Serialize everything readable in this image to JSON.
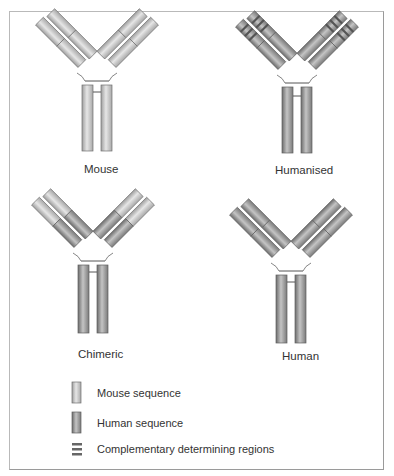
{
  "figure": {
    "antibodies": [
      {
        "id": "mouse",
        "label": "Mouse",
        "variable": "mouse",
        "constant": "mouse",
        "cdr": false
      },
      {
        "id": "humanised",
        "label": "Humanised",
        "variable": "human",
        "constant": "human",
        "cdr": true
      },
      {
        "id": "chimeric",
        "label": "Chimeric",
        "variable": "mouse",
        "constant": "human",
        "cdr": false
      },
      {
        "id": "human",
        "label": "Human",
        "variable": "human",
        "constant": "human",
        "cdr": false
      }
    ],
    "legend": [
      {
        "key": "mouse",
        "label": "Mouse sequence",
        "icon": "light-cylinder-icon"
      },
      {
        "key": "human",
        "label": "Human sequence",
        "icon": "dark-cylinder-icon"
      },
      {
        "key": "cdr",
        "label": "Complementary determining regions",
        "icon": "stripes-icon"
      }
    ],
    "colors": {
      "mouse_light": "#d8d8d8",
      "mouse_mid": "#b4b4b4",
      "human_light": "#bdbdbd",
      "human_mid": "#8a8a8a",
      "cdr_stripe": "#5a5a5a",
      "outline": "#6e6e6e",
      "frame": "#b0b0b0"
    }
  }
}
